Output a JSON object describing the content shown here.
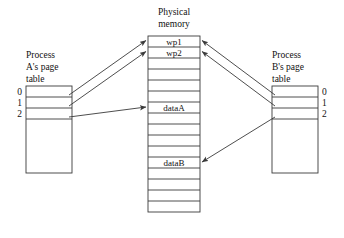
{
  "figure": {
    "colors": {
      "stroke": "#3a3a3a",
      "text": "#111111",
      "background": "#ffffff"
    }
  },
  "physical_memory": {
    "caption_line1": "Physical",
    "caption_line2": "memory",
    "box": {
      "x": 148,
      "y": 36,
      "width": 52,
      "height": 176
    },
    "row_count": 16,
    "labeled_rows": [
      {
        "index": 0,
        "label": "wp1"
      },
      {
        "index": 1,
        "label": "wp2"
      },
      {
        "index": 6,
        "label": "dataA"
      },
      {
        "index": 11,
        "label": "dataB"
      }
    ]
  },
  "process_a": {
    "caption_line1": "Process",
    "caption_line2": "A's page",
    "caption_line3": "table",
    "box": {
      "x": 26,
      "y": 86,
      "width": 46,
      "height": 87
    },
    "entries": [
      {
        "index": "0"
      },
      {
        "index": "1"
      },
      {
        "index": "2"
      }
    ],
    "row_height": 11
  },
  "process_b": {
    "caption_line1": "Process",
    "caption_line2": "B's page",
    "caption_line3": "table",
    "box": {
      "x": 272,
      "y": 86,
      "width": 46,
      "height": 87
    },
    "entries": [
      {
        "index": "0"
      },
      {
        "index": "1"
      },
      {
        "index": "2"
      }
    ],
    "row_height": 11
  },
  "mappings": [
    {
      "from": "process-a-entry-0",
      "to": "wp1"
    },
    {
      "from": "process-a-entry-1",
      "to": "wp2"
    },
    {
      "from": "process-a-entry-2",
      "to": "dataA"
    },
    {
      "from": "process-b-entry-0",
      "to": "wp1"
    },
    {
      "from": "process-b-entry-1",
      "to": "wp2"
    },
    {
      "from": "process-b-entry-2",
      "to": "dataB"
    }
  ]
}
